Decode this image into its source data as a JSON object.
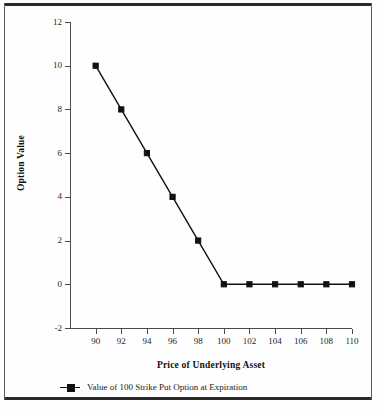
{
  "chart_data": {
    "type": "line",
    "title": "",
    "xlabel": "Price of Underlying Asset",
    "ylabel": "Option Value",
    "xlim": [
      88,
      110
    ],
    "ylim": [
      -2,
      12
    ],
    "xticks": [
      90,
      92,
      94,
      96,
      98,
      100,
      102,
      104,
      106,
      108,
      110
    ],
    "yticks": [
      -2,
      0,
      2,
      4,
      6,
      8,
      10,
      12
    ],
    "grid": false,
    "legend_position": "bottom-left",
    "series": [
      {
        "name": "Value of 100 Strike Put Option at Expiration",
        "marker": "square",
        "color": "#111111",
        "x": [
          90,
          92,
          94,
          96,
          98,
          100,
          102,
          104,
          106,
          108,
          110
        ],
        "values": [
          10,
          8,
          6,
          4,
          2,
          0,
          0,
          0,
          0,
          0,
          0
        ]
      }
    ]
  },
  "axes": {
    "y_title": "Option Value",
    "x_title": "Price of Underlying Asset",
    "y_tick_labels": [
      "12",
      "10",
      "8",
      "6",
      "4",
      "2",
      "0",
      "-2"
    ],
    "x_tick_labels": [
      "90",
      "92",
      "94",
      "96",
      "98",
      "100",
      "102",
      "104",
      "106",
      "108",
      "110"
    ]
  },
  "legend": {
    "entries": [
      {
        "label": "Value of 100 Strike Put Option at Expiration",
        "marker": "square-line-marker"
      }
    ]
  },
  "colors": {
    "series": "#111111",
    "axis": "#4a4a4a",
    "frame": "#2b2b2b",
    "background": "#fefefe",
    "text": "#1a1a1a"
  }
}
